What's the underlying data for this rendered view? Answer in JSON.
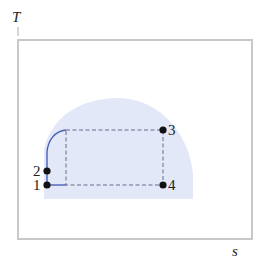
{
  "diagram": {
    "type": "T-s diagram",
    "axes": {
      "y_label": "T",
      "x_label": "s"
    },
    "colors": {
      "frame": "#c8c8c8",
      "dome_fill": "#e3e8f8",
      "process_line": "#4a5fb8",
      "dashed_line": "#6b6b8a",
      "point": "#111111",
      "text": "#222222"
    },
    "points": [
      {
        "id": "1",
        "label": "1",
        "x": 47,
        "y": 185
      },
      {
        "id": "2",
        "label": "2",
        "x": 47,
        "y": 171
      },
      {
        "id": "3",
        "label": "3",
        "x": 163,
        "y": 130
      },
      {
        "id": "4",
        "label": "4",
        "x": 163,
        "y": 185
      }
    ],
    "processes": [
      {
        "from": "1",
        "to": "2",
        "style": "solid",
        "description": "compression along saturated-liquid side"
      },
      {
        "from": "2",
        "to": "3",
        "style": "solid curve then dashed",
        "description": "heating to saturated state"
      },
      {
        "from": "3",
        "to": "4",
        "style": "dashed",
        "description": "isentropic expansion"
      },
      {
        "from": "4",
        "to": "1",
        "style": "dashed then solid",
        "description": "heat rejection at constant T"
      }
    ]
  }
}
